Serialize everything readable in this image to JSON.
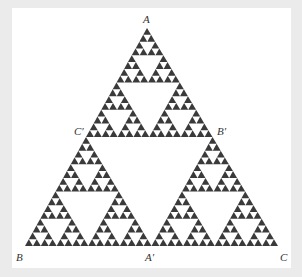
{
  "figure": {
    "type": "sierpinski-triangle",
    "depth": 5,
    "fill_color": "#3a3a3a",
    "background_color": "#ffffff",
    "frame_color": "#ebebeb",
    "vertices": {
      "top": [
        147,
        28
      ],
      "left": [
        25,
        246
      ],
      "right": [
        278,
        246
      ]
    }
  },
  "labels": [
    {
      "id": "A",
      "text": "A",
      "x": 143,
      "y": 14
    },
    {
      "id": "C-prime",
      "text": "C′",
      "x": 74,
      "y": 126
    },
    {
      "id": "B-prime",
      "text": "B′",
      "x": 217,
      "y": 126
    },
    {
      "id": "B",
      "text": "B",
      "x": 16,
      "y": 252
    },
    {
      "id": "A-prime",
      "text": "A′",
      "x": 145,
      "y": 252
    },
    {
      "id": "C",
      "text": "C",
      "x": 280,
      "y": 252
    }
  ]
}
